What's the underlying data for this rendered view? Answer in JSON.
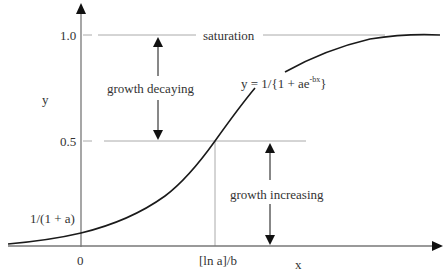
{
  "diagram": {
    "type": "logistic-growth-curve",
    "axes": {
      "x_label": "x",
      "y_label": "y"
    },
    "y_ticks": {
      "one": "1.0",
      "half": "0.5",
      "intercept": "1/(1 + a)"
    },
    "x_ticks": {
      "zero": "0",
      "inflection": "[ln a]/b"
    },
    "annotations": {
      "saturation": "saturation",
      "growth_decaying": "growth decaying",
      "growth_increasing": "growth increasing"
    },
    "equation": {
      "prefix": "y = 1/{1 + ae",
      "exponent": "-bx",
      "suffix": "}"
    },
    "colors": {
      "curve": "#1a1a1a",
      "axis": "#777777",
      "guide": "#999999",
      "arrow": "#111111",
      "text": "#333333"
    }
  }
}
